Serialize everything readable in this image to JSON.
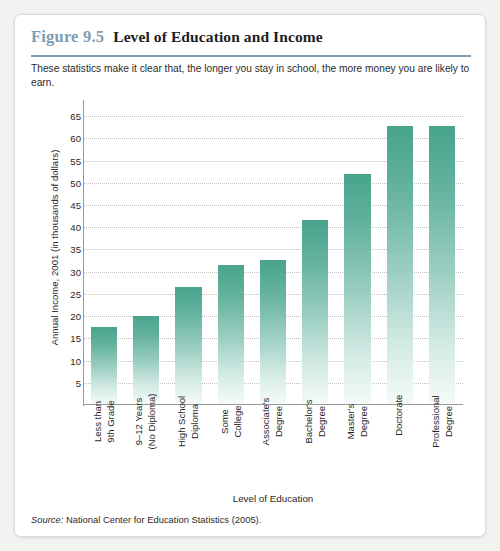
{
  "figure": {
    "number": "Figure 9.5",
    "title": "Level of Education and Income",
    "subtitle": "These statistics make it clear that, the longer you stay in school, the more money you are likely to earn.",
    "source_label": "Source:",
    "source_text": "National Center for Education Statistics (2005).",
    "accent_color": "#7d9cb5",
    "bar_color_top": "#48a48c",
    "bar_color_bottom": "#f4fbf9"
  },
  "chart_data": {
    "type": "bar",
    "title": "Level of Education and Income",
    "xlabel": "Level of Education",
    "ylabel": "Annual Income, 2001 (in thousands of dollars)",
    "categories": [
      "Less than 9th Grade",
      "9–12 Years (No Diploma)",
      "High School Diploma",
      "Some College",
      "Associate's Degree",
      "Bachelor's Degree",
      "Master's Degree",
      "Doctorate",
      "Professional Degree"
    ],
    "category_lines": [
      [
        "Less than",
        "9th Grade"
      ],
      [
        "9–12 Years",
        "(No Diploma)"
      ],
      [
        "High School",
        "Diploma"
      ],
      [
        "Some",
        "College"
      ],
      [
        "Associate's",
        "Degree"
      ],
      [
        "Bachelor's",
        "Degree"
      ],
      [
        "Master's",
        "Degree"
      ],
      [
        "Doctorate"
      ],
      [
        "Professional",
        "Degree"
      ]
    ],
    "values": [
      17.3,
      19.8,
      26.3,
      31.2,
      32.3,
      41.3,
      51.8,
      62.5,
      62.5
    ],
    "ylim": [
      0,
      67.5
    ],
    "yticks": [
      5,
      10,
      15,
      20,
      25,
      30,
      35,
      40,
      45,
      50,
      55,
      60,
      65
    ],
    "ytick_labels": [
      "5",
      "10",
      "15",
      "20",
      "25",
      "30",
      "35",
      "40",
      "45",
      "50",
      "55",
      "60",
      "65"
    ],
    "grid": true,
    "legend": false
  }
}
